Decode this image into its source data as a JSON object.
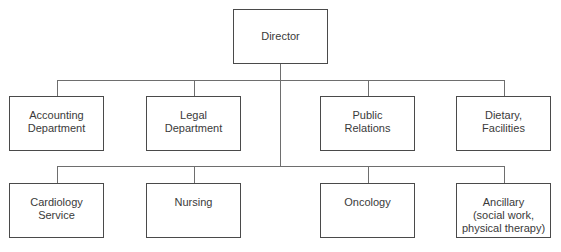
{
  "diagram": {
    "type": "org-chart",
    "root": {
      "id": "director",
      "label": [
        "Director"
      ]
    },
    "rows": [
      [
        {
          "id": "accounting",
          "label": [
            "Accounting",
            "Department"
          ]
        },
        {
          "id": "legal",
          "label": [
            "Legal",
            "Department"
          ]
        },
        {
          "id": "public-relations",
          "label": [
            "Public",
            "Relations"
          ]
        },
        {
          "id": "dietary",
          "label": [
            "Dietary,",
            "Facilities"
          ]
        }
      ],
      [
        {
          "id": "cardiology",
          "label": [
            "Cardiology",
            "Service"
          ]
        },
        {
          "id": "nursing",
          "label": [
            "Nursing"
          ]
        },
        {
          "id": "oncology",
          "label": [
            "Oncology"
          ]
        },
        {
          "id": "ancillary",
          "label": [
            "Ancillary",
            "(social work,",
            "physical therapy)"
          ]
        }
      ]
    ],
    "colors": {
      "border": "#4a4a4a",
      "connector": "#6e6e6e",
      "text": "#3a3a3a"
    }
  }
}
